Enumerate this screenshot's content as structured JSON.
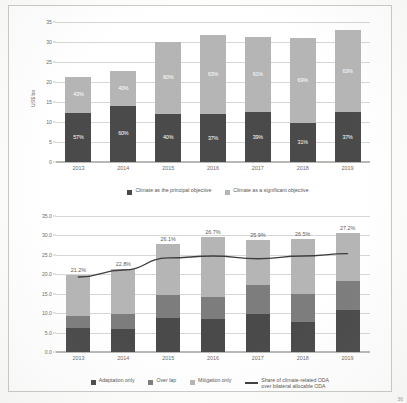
{
  "page": {
    "corner_mark": "36"
  },
  "colors": {
    "dark": "#4a4a4a",
    "mid": "#7d7d7d",
    "light": "#b5b5b5",
    "line": "#3d3d3d",
    "grid": "#d6d6d4",
    "text": "#6b6b6b"
  },
  "chart_data": [
    {
      "id": "top",
      "type": "bar",
      "stacked": true,
      "title": "",
      "xlabel": "",
      "ylabel": "US$ bn",
      "ylim": [
        0,
        35
      ],
      "yticks": [
        "0",
        "5",
        "10",
        "15",
        "20",
        "25",
        "30",
        "35"
      ],
      "ytick_values": [
        0,
        5,
        10,
        15,
        20,
        25,
        30,
        35
      ],
      "grid": true,
      "legend_position": "bottom",
      "categories": [
        "2013",
        "2014",
        "2015",
        "2016",
        "2017",
        "2018",
        "2019"
      ],
      "series": [
        {
          "name": "Climate as the principal objective",
          "color": "#4a4a4a",
          "values": [
            12.3,
            14.0,
            12.1,
            11.9,
            12.4,
            9.8,
            12.4
          ],
          "labels": [
            "57%",
            "60%",
            "40%",
            "37%",
            "39%",
            "31%",
            "37%"
          ]
        },
        {
          "name": "Climate as a significant objective",
          "color": "#b5b5b5",
          "values": [
            9.0,
            8.8,
            17.9,
            19.8,
            18.8,
            21.2,
            20.5
          ],
          "labels": [
            "43%",
            "40%",
            "60%",
            "63%",
            "61%",
            "69%",
            "63%"
          ]
        }
      ],
      "totals": [
        21.3,
        22.8,
        30.0,
        31.7,
        31.2,
        31.0,
        32.9
      ]
    },
    {
      "id": "bottom",
      "type": "bar",
      "stacked": true,
      "title": "",
      "xlabel": "",
      "ylabel": "",
      "ylim": [
        0,
        35
      ],
      "yticks": [
        "0.0",
        "5.0",
        "10.0",
        "15.0",
        "20.0",
        "25.0",
        "30.0",
        "35.0"
      ],
      "ytick_values": [
        0,
        5,
        10,
        15,
        20,
        25,
        30,
        35
      ],
      "grid": true,
      "legend_position": "bottom",
      "categories": [
        "2013",
        "2014",
        "2015",
        "2016",
        "2017",
        "2018",
        "2019"
      ],
      "series": [
        {
          "name": "Adaptation only",
          "color": "#4a4a4a",
          "values": [
            6.1,
            6.0,
            8.8,
            8.4,
            9.8,
            7.6,
            10.8
          ]
        },
        {
          "name": "Over lap",
          "color": "#7d7d7d",
          "values": [
            3.1,
            3.9,
            5.8,
            5.8,
            7.5,
            7.2,
            7.4
          ]
        },
        {
          "name": "Mitigation only",
          "color": "#b5b5b5",
          "values": [
            10.6,
            11.4,
            13.2,
            15.3,
            11.6,
            14.2,
            12.3
          ]
        }
      ],
      "line_series": {
        "name": "Share of climate-related ODA over bilateral allocable ODA",
        "color": "#3d3d3d",
        "values": [
          19.3,
          21.1,
          24.2,
          24.7,
          24.0,
          24.7,
          25.3
        ],
        "labels": [
          "21.2%",
          "22.8%",
          "26.1%",
          "26.7%",
          "25.9%",
          "26.5%",
          "27.2%"
        ]
      },
      "totals": [
        19.8,
        21.3,
        27.8,
        29.5,
        28.9,
        29.0,
        30.5
      ]
    }
  ]
}
